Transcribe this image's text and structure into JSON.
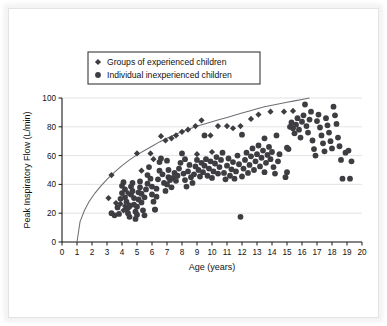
{
  "figure": {
    "caption_present": false,
    "marker_color": "#3d3d42",
    "curve_color": "#6f6f77",
    "grid_color": "#e0e0e0",
    "axis_color": "#1a1a1a"
  },
  "legend": {
    "position": "upper-left",
    "entries": [
      {
        "marker": "diamond",
        "label": "Groups of experienced children"
      },
      {
        "marker": "circle",
        "label": "Individual inexperienced children"
      }
    ]
  },
  "chart_data": {
    "type": "scatter",
    "title": "",
    "xlabel": "Age (years)",
    "ylabel": "Peak Inspiratory Flow (L/min)",
    "xlim": [
      0,
      20
    ],
    "ylim": [
      0,
      100
    ],
    "xticks": [
      0,
      1,
      2,
      3,
      4,
      5,
      6,
      7,
      8,
      9,
      10,
      11,
      12,
      13,
      14,
      15,
      16,
      17,
      18,
      19,
      20
    ],
    "yticks": [
      0,
      20,
      40,
      60,
      80,
      100
    ],
    "xtick_labels": [
      "0",
      "1",
      "2",
      "3",
      "4",
      "5",
      "6",
      "7",
      "8",
      "9",
      "10",
      "11",
      "12",
      "13",
      "14",
      "15",
      "16",
      "17",
      "18",
      "19",
      "20"
    ],
    "ytick_labels": [
      "0",
      "20",
      "40",
      "60",
      "80",
      "100"
    ],
    "grid": "horizontal",
    "legend_position": "upper-left",
    "annotations": [
      {
        "text": "reference curve rises from (1, 0) to about (16.5, 100)"
      },
      {
        "text": "isolated low outlier near (11.9, 17.5)"
      }
    ],
    "series": [
      {
        "name": "Groups of experienced children",
        "marker": "diamond",
        "color": "#3d3d42",
        "points": [
          [
            3.1,
            30.5
          ],
          [
            3.6,
            27.0
          ],
          [
            3.9,
            26.5
          ],
          [
            4.2,
            25.0
          ],
          [
            4.5,
            24.0
          ],
          [
            4.1,
            22.0
          ],
          [
            3.3,
            46.5
          ],
          [
            4.4,
            34.0
          ],
          [
            5.0,
            61.5
          ],
          [
            5.3,
            49.5
          ],
          [
            5.9,
            61.5
          ],
          [
            6.1,
            57.5
          ],
          [
            6.6,
            73.5
          ],
          [
            6.9,
            70.5
          ],
          [
            7.3,
            72.0
          ],
          [
            7.6,
            74.0
          ],
          [
            8.0,
            76.5
          ],
          [
            8.4,
            78.0
          ],
          [
            8.9,
            80.5
          ],
          [
            9.3,
            84.5
          ],
          [
            9.9,
            74.0
          ],
          [
            10.4,
            80.5
          ],
          [
            11.0,
            80.5
          ],
          [
            11.4,
            79.0
          ],
          [
            11.9,
            80.5
          ],
          [
            12.6,
            85.5
          ],
          [
            13.1,
            88.5
          ],
          [
            13.9,
            90.5
          ],
          [
            14.8,
            90.5
          ],
          [
            15.4,
            91.0
          ],
          [
            10.0,
            62.5
          ],
          [
            9.0,
            61.0
          ]
        ]
      },
      {
        "name": "Individual inexperienced children",
        "marker": "circle",
        "color": "#3d3d42",
        "points": [
          [
            3.3,
            20.0
          ],
          [
            3.5,
            18.5
          ],
          [
            3.7,
            24.0
          ],
          [
            3.8,
            19.5
          ],
          [
            3.9,
            30.0
          ],
          [
            4.0,
            34.0
          ],
          [
            4.0,
            39.0
          ],
          [
            4.1,
            41.5
          ],
          [
            4.2,
            36.5
          ],
          [
            4.2,
            31.0
          ],
          [
            4.3,
            28.0
          ],
          [
            4.3,
            22.5
          ],
          [
            4.4,
            20.0
          ],
          [
            4.5,
            17.5
          ],
          [
            4.5,
            25.5
          ],
          [
            4.6,
            33.0
          ],
          [
            4.6,
            38.5
          ],
          [
            4.7,
            41.0
          ],
          [
            4.7,
            35.5
          ],
          [
            4.8,
            30.5
          ],
          [
            4.8,
            26.0
          ],
          [
            4.9,
            21.0
          ],
          [
            4.9,
            16.0
          ],
          [
            5.0,
            19.0
          ],
          [
            5.0,
            24.5
          ],
          [
            5.1,
            29.5
          ],
          [
            5.1,
            34.5
          ],
          [
            5.2,
            38.0
          ],
          [
            5.2,
            42.0
          ],
          [
            5.3,
            33.5
          ],
          [
            5.3,
            27.5
          ],
          [
            5.4,
            22.0
          ],
          [
            5.5,
            18.5
          ],
          [
            5.5,
            31.0
          ],
          [
            5.6,
            36.5
          ],
          [
            5.7,
            40.5
          ],
          [
            5.7,
            46.5
          ],
          [
            5.8,
            52.0
          ],
          [
            5.9,
            44.0
          ],
          [
            6.0,
            38.5
          ],
          [
            6.0,
            33.0
          ],
          [
            6.1,
            28.0
          ],
          [
            6.2,
            22.5
          ],
          [
            6.3,
            31.5
          ],
          [
            6.3,
            37.0
          ],
          [
            6.4,
            43.5
          ],
          [
            6.5,
            49.5
          ],
          [
            6.5,
            55.5
          ],
          [
            6.6,
            58.0
          ],
          [
            6.7,
            47.0
          ],
          [
            6.8,
            41.0
          ],
          [
            6.9,
            35.5
          ],
          [
            7.0,
            40.0
          ],
          [
            7.1,
            45.0
          ],
          [
            7.1,
            50.0
          ],
          [
            7.2,
            43.0
          ],
          [
            7.3,
            38.0
          ],
          [
            7.4,
            44.5
          ],
          [
            7.5,
            48.0
          ],
          [
            7.6,
            42.5
          ],
          [
            7.7,
            46.0
          ],
          [
            7.8,
            51.0
          ],
          [
            7.9,
            55.0
          ],
          [
            8.0,
            61.5
          ],
          [
            8.1,
            47.5
          ],
          [
            8.2,
            43.0
          ],
          [
            8.3,
            38.5
          ],
          [
            8.4,
            49.0
          ],
          [
            8.5,
            53.5
          ],
          [
            8.6,
            45.0
          ],
          [
            8.7,
            41.0
          ],
          [
            8.8,
            47.0
          ],
          [
            8.9,
            52.5
          ],
          [
            9.0,
            57.0
          ],
          [
            9.1,
            50.0
          ],
          [
            9.2,
            45.5
          ],
          [
            9.3,
            55.0
          ],
          [
            9.4,
            48.5
          ],
          [
            9.5,
            53.0
          ],
          [
            9.6,
            57.5
          ],
          [
            9.7,
            46.0
          ],
          [
            9.8,
            51.0
          ],
          [
            9.9,
            56.0
          ],
          [
            10.0,
            44.5
          ],
          [
            10.1,
            49.0
          ],
          [
            10.2,
            54.5
          ],
          [
            10.3,
            59.0
          ],
          [
            10.4,
            47.5
          ],
          [
            10.5,
            52.0
          ],
          [
            10.6,
            57.0
          ],
          [
            10.7,
            62.0
          ],
          [
            10.8,
            48.0
          ],
          [
            10.9,
            43.5
          ],
          [
            11.0,
            53.0
          ],
          [
            11.1,
            58.0
          ],
          [
            11.2,
            46.0
          ],
          [
            11.3,
            50.5
          ],
          [
            11.4,
            55.5
          ],
          [
            11.5,
            44.0
          ],
          [
            11.6,
            49.0
          ],
          [
            11.7,
            60.0
          ],
          [
            11.8,
            54.0
          ],
          [
            11.9,
            17.5
          ],
          [
            12.0,
            45.5
          ],
          [
            12.1,
            51.0
          ],
          [
            12.2,
            57.0
          ],
          [
            12.3,
            62.0
          ],
          [
            12.4,
            48.0
          ],
          [
            12.5,
            53.5
          ],
          [
            12.6,
            59.5
          ],
          [
            12.7,
            65.0
          ],
          [
            12.8,
            50.0
          ],
          [
            12.9,
            56.0
          ],
          [
            13.0,
            61.0
          ],
          [
            13.1,
            67.0
          ],
          [
            13.2,
            52.5
          ],
          [
            13.3,
            58.5
          ],
          [
            13.4,
            63.5
          ],
          [
            13.5,
            48.5
          ],
          [
            13.6,
            55.0
          ],
          [
            13.7,
            60.5
          ],
          [
            13.8,
            66.0
          ],
          [
            13.9,
            57.5
          ],
          [
            14.0,
            62.5
          ],
          [
            14.1,
            52.0
          ],
          [
            14.2,
            47.5
          ],
          [
            14.3,
            74.0
          ],
          [
            14.5,
            61.0
          ],
          [
            14.9,
            45.0
          ],
          [
            15.0,
            65.5
          ],
          [
            15.1,
            64.5
          ],
          [
            15.2,
            80.0
          ],
          [
            15.3,
            83.0
          ],
          [
            15.4,
            79.0
          ],
          [
            15.5,
            75.5
          ],
          [
            15.6,
            81.5
          ],
          [
            15.7,
            86.0
          ],
          [
            15.8,
            78.0
          ],
          [
            15.9,
            72.5
          ],
          [
            16.0,
            83.5
          ],
          [
            16.1,
            88.0
          ],
          [
            16.2,
            95.5
          ],
          [
            16.3,
            80.5
          ],
          [
            16.4,
            76.0
          ],
          [
            16.5,
            85.0
          ],
          [
            16.6,
            90.5
          ],
          [
            16.7,
            70.5
          ],
          [
            16.8,
            64.5
          ],
          [
            16.9,
            60.0
          ],
          [
            17.0,
            84.0
          ],
          [
            17.1,
            88.5
          ],
          [
            17.2,
            79.5
          ],
          [
            17.3,
            74.0
          ],
          [
            17.4,
            68.5
          ],
          [
            17.5,
            63.0
          ],
          [
            17.6,
            86.0
          ],
          [
            17.7,
            81.0
          ],
          [
            17.8,
            76.0
          ],
          [
            17.9,
            70.0
          ],
          [
            18.0,
            65.0
          ],
          [
            18.1,
            94.0
          ],
          [
            18.2,
            88.0
          ],
          [
            18.3,
            82.0
          ],
          [
            18.4,
            72.5
          ],
          [
            18.5,
            66.5
          ],
          [
            18.6,
            57.0
          ],
          [
            18.7,
            44.0
          ],
          [
            18.9,
            62.0
          ],
          [
            19.1,
            63.5
          ],
          [
            19.3,
            56.0
          ],
          [
            19.2,
            44.0
          ],
          [
            6.2,
            22.5
          ],
          [
            7.0,
            56.5
          ],
          [
            8.2,
            57.5
          ],
          [
            9.5,
            74.0
          ],
          [
            12.0,
            74.5
          ],
          [
            13.5,
            72.0
          ],
          [
            14.4,
            56.0
          ],
          [
            15.0,
            48.5
          ]
        ]
      }
    ],
    "curve": {
      "name": "upper reference curve",
      "color": "#6f6f77",
      "points": [
        [
          1.0,
          0
        ],
        [
          1.2,
          14
        ],
        [
          1.5,
          22
        ],
        [
          1.8,
          28
        ],
        [
          2.2,
          34
        ],
        [
          2.6,
          39
        ],
        [
          3.0,
          43.5
        ],
        [
          3.5,
          48.5
        ],
        [
          4.0,
          53
        ],
        [
          4.5,
          57
        ],
        [
          5.0,
          60.5
        ],
        [
          5.5,
          63.5
        ],
        [
          6.0,
          66.5
        ],
        [
          6.5,
          69.5
        ],
        [
          7.0,
          72
        ],
        [
          7.5,
          74.5
        ],
        [
          8.0,
          76.5
        ],
        [
          8.5,
          78.5
        ],
        [
          9.0,
          80.5
        ],
        [
          9.5,
          82
        ],
        [
          10.0,
          83.5
        ],
        [
          10.5,
          85
        ],
        [
          11.0,
          86.5
        ],
        [
          11.5,
          88
        ],
        [
          12.0,
          89.5
        ],
        [
          12.5,
          91
        ],
        [
          13.0,
          92.5
        ],
        [
          13.5,
          94
        ],
        [
          14.0,
          95
        ],
        [
          14.5,
          96
        ],
        [
          15.0,
          97
        ],
        [
          15.5,
          98
        ],
        [
          16.0,
          99
        ],
        [
          16.5,
          100
        ]
      ]
    }
  }
}
